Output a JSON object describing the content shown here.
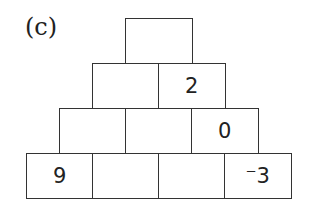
{
  "label": "(c)",
  "pyramid": {
    "rows": [
      [
        ""
      ],
      [
        "",
        "2"
      ],
      [
        "",
        "",
        "0"
      ],
      [
        "9",
        "",
        "",
        "⁻3"
      ]
    ]
  }
}
